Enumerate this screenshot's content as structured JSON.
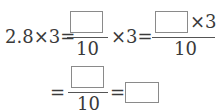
{
  "equation": {
    "line1": {
      "lhs": "2.8×3=",
      "frac1": {
        "numerator_box": "",
        "denominator": "10"
      },
      "times3_eq": "×3=",
      "frac2": {
        "numerator_box": "",
        "numerator_suffix": "×3",
        "denominator": "10"
      }
    },
    "line2": {
      "eq1": "=",
      "frac3": {
        "numerator_box": "",
        "denominator": "10"
      },
      "eq2": "=",
      "answer_box": ""
    }
  }
}
